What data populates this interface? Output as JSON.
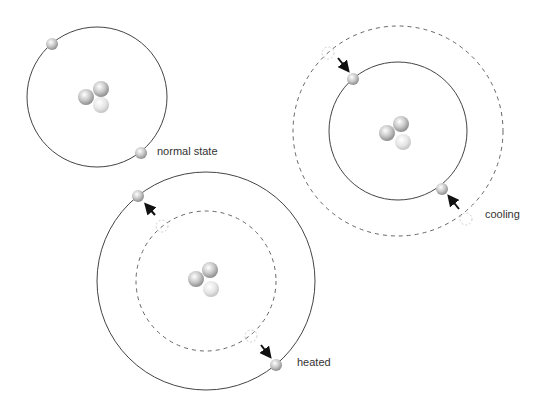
{
  "labels": {
    "normal": "normal state",
    "cooling": "cooling",
    "heated": "heated"
  },
  "colors": {
    "orbit": "#444444",
    "dashed_orbit": "#555555",
    "arrow": "#111111",
    "electron": "#b8b8b8",
    "ghost": "#cccccc"
  }
}
